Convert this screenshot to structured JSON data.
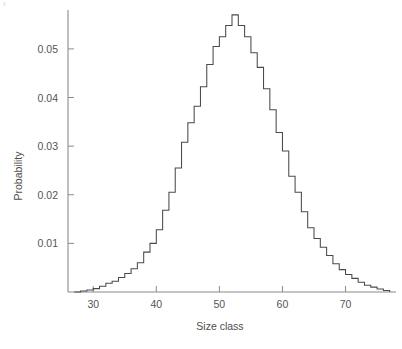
{
  "figure": {
    "corner_mark": "‖"
  },
  "chart_data": {
    "type": "bar",
    "render_style": "step-histogram-outline",
    "title": "",
    "subtitle": "",
    "xlabel": "Size class",
    "ylabel": "Probability",
    "xlim": [
      26,
      78
    ],
    "ylim": [
      0,
      0.058
    ],
    "xticks": [
      30,
      40,
      50,
      60,
      70
    ],
    "xtick_labels": [
      "30",
      "40",
      "50",
      "60",
      "70"
    ],
    "yticks": [
      0.01,
      0.02,
      0.03,
      0.04,
      0.05
    ],
    "ytick_labels": [
      "0.01",
      "0.02",
      "0.03",
      "0.04",
      "0.05"
    ],
    "grid": false,
    "legend": null,
    "legend_position": "none",
    "bin_width": 1.5,
    "line_color": "#4a4a4a",
    "axis_color": "#8a8a8a",
    "text_color": "#555555",
    "annotations": [],
    "categories": [
      27.5,
      29.0,
      30.5,
      32.0,
      33.5,
      35.0,
      36.5,
      38.0,
      39.5,
      41.0,
      42.5,
      44.0,
      45.5,
      47.0,
      48.5,
      50.0,
      51.5,
      53.0,
      54.5,
      56.0,
      57.5,
      59.0,
      60.5,
      62.0,
      63.5,
      65.0,
      66.5,
      68.0,
      69.5,
      71.0,
      72.5,
      74.0,
      75.5,
      77.0
    ],
    "values": [
      0.0002,
      0.0005,
      0.0011,
      0.0018,
      0.0028,
      0.004,
      0.0058,
      0.0082,
      0.011,
      0.0148,
      0.019,
      0.023,
      0.0272,
      0.0315,
      0.037,
      0.042,
      0.0468,
      0.05,
      0.0525,
      0.0545,
      0.057,
      0.0552,
      0.052,
      0.048,
      0.0432,
      0.0378,
      0.0322,
      0.0268,
      0.0212,
      0.0162,
      0.0118,
      0.0082,
      0.0054,
      0.003
    ],
    "step_series": {
      "x": [
        27.0,
        28.0,
        29.0,
        30.0,
        31.0,
        32.0,
        33.0,
        34.0,
        35.0,
        36.0,
        37.0,
        38.0,
        39.0,
        40.0,
        41.0,
        42.0,
        43.0,
        44.0,
        45.0,
        46.0,
        47.0,
        48.0,
        49.0,
        50.0,
        51.0,
        52.0,
        53.0,
        54.0,
        55.0,
        56.0,
        57.0,
        58.0,
        59.0,
        60.0,
        61.0,
        62.0,
        63.0,
        64.0,
        65.0,
        66.0,
        67.0,
        68.0,
        69.0,
        70.0,
        71.0,
        72.0,
        73.0,
        74.0,
        75.0,
        76.0,
        77.0
      ],
      "y": [
        0.0,
        0.0002,
        0.0004,
        0.0007,
        0.0012,
        0.0018,
        0.0022,
        0.003,
        0.0038,
        0.0048,
        0.006,
        0.0082,
        0.01,
        0.0128,
        0.0168,
        0.0205,
        0.0255,
        0.0308,
        0.0348,
        0.0382,
        0.0422,
        0.0468,
        0.0505,
        0.0525,
        0.0548,
        0.057,
        0.0548,
        0.0525,
        0.0492,
        0.0462,
        0.0418,
        0.0375,
        0.0328,
        0.029,
        0.0238,
        0.0205,
        0.0165,
        0.0132,
        0.011,
        0.0092,
        0.0075,
        0.0058,
        0.0046,
        0.0036,
        0.0028,
        0.002,
        0.0014,
        0.001,
        0.0006,
        0.0003,
        0.0
      ]
    }
  }
}
